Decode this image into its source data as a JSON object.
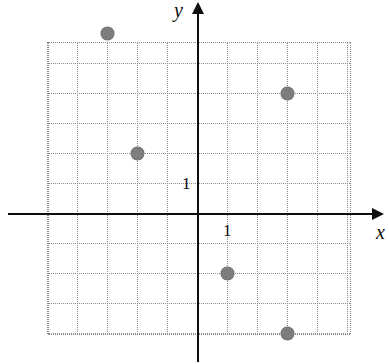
{
  "figure": {
    "width": 389,
    "height": 364,
    "background_color": "#ffffff"
  },
  "chart_data": {
    "type": "scatter",
    "title": "",
    "xlabel": "x",
    "ylabel": "y",
    "grid": true,
    "grid_style": "dotted",
    "grid_color": "#8a8a8a",
    "axis_color": "#0d0d0d",
    "point_color": "#7d7d7d",
    "legend": "none",
    "unit_per_cell": 1,
    "xlim": [
      -5,
      5
    ],
    "ylim": [
      -4,
      6
    ],
    "xticks": [
      -5,
      -4,
      -3,
      -2,
      -1,
      0,
      1,
      2,
      3,
      4,
      5
    ],
    "yticks": [
      -4,
      -3,
      -2,
      -1,
      0,
      1,
      2,
      3,
      4,
      5,
      6
    ],
    "x_tick_labels_shown": [
      "1"
    ],
    "y_tick_labels_shown": [
      "1"
    ],
    "points": [
      {
        "x": -3,
        "y": 6
      },
      {
        "x": 3,
        "y": 4
      },
      {
        "x": -2,
        "y": 2
      },
      {
        "x": 1,
        "y": -2
      },
      {
        "x": 3,
        "y": -4
      }
    ]
  },
  "labels": {
    "x_axis": "x",
    "y_axis": "y",
    "x_unit_tick": "1",
    "y_unit_tick": "1"
  },
  "geometry": {
    "origin_px": {
      "x": 197,
      "y": 213
    },
    "cell_px": 30,
    "grid_left_px": 48,
    "grid_right_px": 350,
    "grid_top_px": 42,
    "grid_bottom_px": 334,
    "x_axis_start_px": 8,
    "x_axis_end_px": 372,
    "y_axis_top_px": 14,
    "y_axis_bottom_px": 362,
    "point_radius_px": 6.5
  }
}
